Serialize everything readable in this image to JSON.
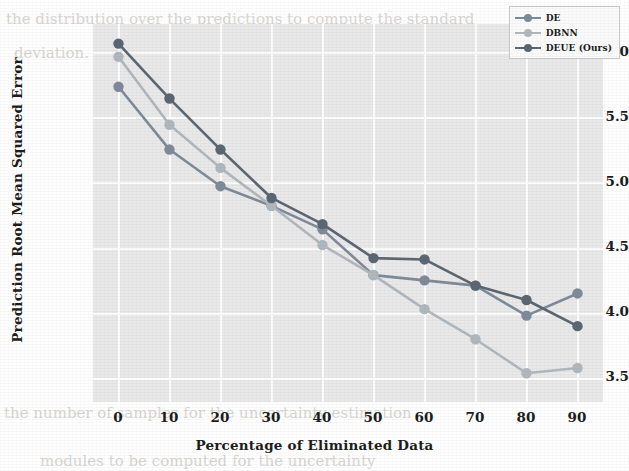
{
  "chart_data": {
    "type": "line",
    "title": "",
    "xlabel": "Percentage of Eliminated Data",
    "ylabel": "Prediction Root Mean Squared Error",
    "x": [
      0,
      10,
      20,
      30,
      40,
      50,
      60,
      70,
      80,
      90
    ],
    "xticklabels": [
      "0",
      "10",
      "20",
      "30",
      "40",
      "50",
      "60",
      "70",
      "80",
      "90"
    ],
    "yticklabels": [
      "6.0",
      "5.5",
      "5.0",
      "4.5",
      "4.0",
      "3.5"
    ],
    "yticks": [
      6.0,
      5.5,
      5.0,
      4.5,
      4.0,
      3.5
    ],
    "xlim": [
      -5,
      95
    ],
    "ylim": [
      3.36,
      6.25
    ],
    "grid": true,
    "legend_position": "upper right",
    "series": [
      {
        "name": "DE",
        "color": "#7f8b98",
        "marker": "o",
        "values": [
          5.77,
          5.29,
          5.01,
          4.86,
          4.68,
          4.33,
          4.29,
          4.25,
          4.02,
          4.19
        ]
      },
      {
        "name": "DBNN",
        "color": "#b1b8bd",
        "marker": "o",
        "values": [
          6.0,
          5.48,
          5.15,
          4.86,
          4.56,
          4.33,
          4.07,
          3.84,
          3.58,
          3.62
        ]
      },
      {
        "name": "DEUE (Ours)",
        "color": "#5b6772",
        "marker": "o",
        "values": [
          6.1,
          5.68,
          5.29,
          4.92,
          4.72,
          4.46,
          4.45,
          4.25,
          4.14,
          3.94
        ]
      }
    ]
  },
  "figure": {
    "background_color": "#ffffff",
    "plot_background_color": "#e9e9e9",
    "grid_color": "#fdfdfd"
  },
  "legend": {
    "entries": [
      "DE",
      "DBNN",
      "DEUE (Ours)"
    ]
  },
  "page_bleed": {
    "lines": [
      "the distribution over the predictions to compute the standard",
      "deviation. In the same way, on classification tasks",
      "Bayesian Neural Networks",
      "DEUE",
      "the number of samples for the uncertainty estimation",
      "modules to be computed for the uncertainty"
    ]
  }
}
